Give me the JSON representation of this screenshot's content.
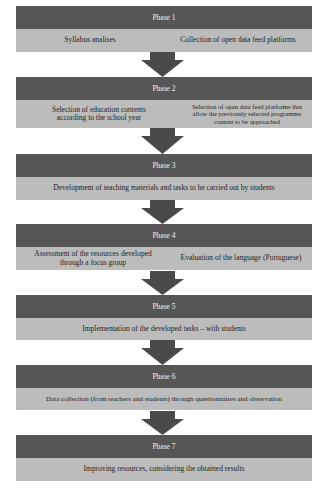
{
  "diagram": {
    "colors": {
      "header_bg": "#565656",
      "header_text": "#f2f2f2",
      "body_bg": "#bcbcbc",
      "body_text": "#1e1e1e",
      "arrow": "#4a4a4a"
    },
    "phases": [
      {
        "title": "Phase 1",
        "items": [
          "Syllabus analises",
          "Collection of open data feed platforms"
        ]
      },
      {
        "title": "Phase 2",
        "items": [
          "Selection of education contents according to the school year",
          "Selection of open data feed platforms that allow the previously selected programme content to be approached"
        ]
      },
      {
        "title": "Phase 3",
        "items": [
          "Development of teaching materials and tasks to be carried out by students"
        ]
      },
      {
        "title": "Phase 4",
        "items": [
          "Assessment of the resources developed through a focus group",
          "Evaluation of the language (Portuguese)"
        ]
      },
      {
        "title": "Phase 5",
        "items": [
          "Implementation of the developed tasks – with students"
        ]
      },
      {
        "title": "Phase 6",
        "items": [
          "Data collection (from teachers and students) through questionnaires and observation"
        ]
      },
      {
        "title": "Phase 7",
        "items": [
          "Improving resources, considering the obtained results"
        ]
      }
    ],
    "connectors": [
      {
        "from": "Phase 1",
        "to": "Phase 2",
        "icon": "down-arrow-icon"
      },
      {
        "from": "Phase 2",
        "to": "Phase 3",
        "icon": "down-arrow-icon"
      },
      {
        "from": "Phase 3",
        "to": "Phase 4",
        "icon": "down-arrow-icon"
      },
      {
        "from": "Phase 4",
        "to": "Phase 5",
        "icon": "down-arrow-icon"
      },
      {
        "from": "Phase 5",
        "to": "Phase 6",
        "icon": "down-arrow-icon"
      },
      {
        "from": "Phase 6",
        "to": "Phase 7",
        "icon": "down-arrow-icon"
      }
    ]
  }
}
